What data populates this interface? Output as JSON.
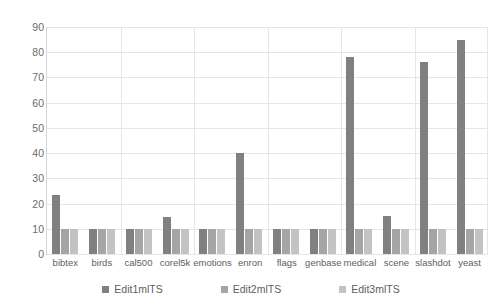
{
  "chart_data": {
    "type": "bar",
    "title": "",
    "subtitle": "",
    "xlabel": "",
    "ylabel": "",
    "ylim": [
      0,
      90
    ],
    "yticks": [
      0,
      10,
      20,
      30,
      40,
      50,
      60,
      70,
      80,
      90
    ],
    "grid": true,
    "legend_position": "bottom",
    "categories": [
      "bibtex",
      "birds",
      "cal500",
      "corel5k",
      "emotions",
      "enron",
      "flags",
      "genbase",
      "medical",
      "scene",
      "slashdot",
      "yeast"
    ],
    "series": [
      {
        "name": "Edit1mlTS",
        "color": "#808080",
        "values": [
          23.5,
          10,
          10,
          14.5,
          10,
          40,
          10,
          10,
          78,
          15,
          76,
          85
        ]
      },
      {
        "name": "Edit2mlTS",
        "color": "#a5a5a5",
        "values": [
          10,
          10,
          10,
          10,
          10,
          10,
          10,
          10,
          10,
          10,
          10,
          10
        ]
      },
      {
        "name": "Edit3mlTS",
        "color": "#c3c3c3",
        "values": [
          10,
          10,
          10,
          10,
          10,
          10,
          10,
          10,
          10,
          10,
          10,
          10
        ]
      }
    ]
  },
  "axis": {
    "y_tick_labels": [
      "0",
      "10",
      "20",
      "30",
      "40",
      "50",
      "60",
      "70",
      "80",
      "90"
    ]
  },
  "legend": {
    "items": [
      {
        "label": "Edit1mlTS",
        "color": "#808080"
      },
      {
        "label": "Edit2mlTS",
        "color": "#a5a5a5"
      },
      {
        "label": "Edit3mlTS",
        "color": "#c3c3c3"
      }
    ]
  },
  "colors": {
    "gridline": "#e4e7ea",
    "axis": "#d3d6d9",
    "tick_text": "#6b6b6b",
    "label_text": "#5e5e5e",
    "background": "#ffffff"
  }
}
